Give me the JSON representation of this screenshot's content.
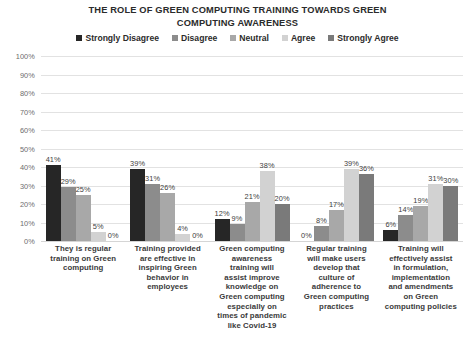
{
  "chart_data": {
    "type": "bar",
    "title": "THE ROLE OF GREEN COMPUTING TRAINING TOWARDS GREEN COMPUTING AWARENESS",
    "title_lines": [
      "THE ROLE OF GREEN COMPUTING TRAINING TOWARDS GREEN",
      "COMPUTING AWARENESS"
    ],
    "xlabel": "",
    "ylabel": "",
    "ylim": [
      0,
      100
    ],
    "grid": true,
    "legend_position": "top",
    "value_suffix": "%",
    "categories": [
      "They is regular training on Green computing",
      "Training provided are effective in inspiring Green behavior in employees",
      "Green computing awareness training will assist improve knowledge on Green computing especially on times of pandemic like Covid-19",
      "Regular training will make users develop that culture of adherence to Green computing practices",
      "Training will effectively assist in formulation, implementation and amendments on Green computing policies"
    ],
    "series": [
      {
        "name": "Strongly Disagree",
        "color": "#262626",
        "values": [
          41,
          39,
          12,
          0,
          6
        ],
        "labels": [
          "41%",
          "39%",
          "12%",
          "0%",
          "6%"
        ]
      },
      {
        "name": "Disagree",
        "color": "#8c8c8c",
        "values": [
          29,
          31,
          9,
          8,
          14
        ],
        "labels": [
          "29%",
          "31%",
          "9%",
          "8%",
          "14%"
        ]
      },
      {
        "name": "Neutral",
        "color": "#a8a8a8",
        "values": [
          25,
          26,
          21,
          17,
          19
        ],
        "labels": [
          "25%",
          "26%",
          "21%",
          "17%",
          "19%"
        ]
      },
      {
        "name": "Agree",
        "color": "#d2d2d2",
        "values": [
          5,
          4,
          38,
          39,
          31
        ],
        "labels": [
          "5%",
          "4%",
          "38%",
          "39%",
          "31%"
        ]
      },
      {
        "name": "Strongly Agree",
        "color": "#7a7a7a",
        "values": [
          0,
          0,
          20,
          36,
          30
        ],
        "labels": [
          "0%",
          "0%",
          "20%",
          "36%",
          "30%"
        ]
      }
    ],
    "yticks": [
      "100%",
      "90%",
      "80%",
      "70%",
      "60%",
      "50%",
      "40%",
      "30%",
      "20%",
      "10%",
      "0%"
    ],
    "ytick_values": [
      100,
      90,
      80,
      70,
      60,
      50,
      40,
      30,
      20,
      10,
      0
    ]
  },
  "legend": {
    "items": [
      {
        "label": "Strongly Disagree",
        "color": "#262626"
      },
      {
        "label": "Disagree",
        "color": "#8c8c8c"
      },
      {
        "label": "Neutral",
        "color": "#a8a8a8"
      },
      {
        "label": "Agree",
        "color": "#d2d2d2"
      },
      {
        "label": "Strongly Agree",
        "color": "#7a7a7a"
      }
    ]
  },
  "category_label_lines": [
    [
      "They is regular",
      "training on Green",
      "computing"
    ],
    [
      "Training provided",
      "are effective in",
      "inspiring Green",
      "behavior in",
      "employees"
    ],
    [
      "Green computing",
      "awareness",
      "training will",
      "assist improve",
      "knowledge on",
      "Green computing",
      "especially on",
      "times of pandemic",
      "like Covid-19"
    ],
    [
      "Regular training",
      "will make users",
      "develop that",
      "culture of",
      "adherence to",
      "Green computing",
      "practices"
    ],
    [
      "Training will",
      "effectively assist",
      "in formulation,",
      "implementation",
      "and amendments",
      "on Green",
      "computing policies"
    ]
  ]
}
